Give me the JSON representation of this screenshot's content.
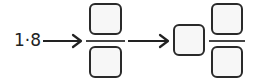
{
  "problem": {
    "given_value": "1·8",
    "steps": [
      {
        "type": "fraction",
        "numerator": "",
        "denominator": ""
      },
      {
        "type": "mixed_number",
        "whole": "",
        "numerator": "",
        "denominator": ""
      }
    ],
    "colors": {
      "stroke": "#2a2a2a",
      "box_fill": "#f7f7f7"
    }
  }
}
